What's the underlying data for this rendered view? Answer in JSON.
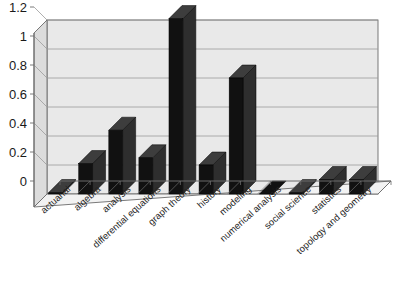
{
  "chart_data": {
    "type": "bar",
    "title": "",
    "subtitle": "",
    "xlabel": "",
    "ylabel": "",
    "categories": [
      "actuarial",
      "algebra",
      "analysis",
      "differential equations",
      "graph theory",
      "history",
      "modeling",
      "numerical analysis",
      "social science",
      "statistics",
      "topology and geometry"
    ],
    "values": [
      0.01,
      0.21,
      0.44,
      0.25,
      1.21,
      0.2,
      0.8,
      0.0,
      0.01,
      0.1,
      0.1
    ],
    "ytick_labels": [
      "0",
      "0.2",
      "0.4",
      "0.6",
      "0.8",
      "1",
      "1.2"
    ],
    "ytick_values": [
      0,
      0.2,
      0.4,
      0.6,
      0.8,
      1,
      1.2
    ],
    "ylim": [
      0,
      1.2
    ],
    "grid": true,
    "legend": false,
    "legend_position": "none",
    "style": "3d-column",
    "colors": {
      "bar_fill": "#111111",
      "bar_side": "#2e2e2e",
      "bar_top": "#3d3d3d",
      "plot_background": "#e9e9e9",
      "wall_side": "#dcdcdc",
      "floor": "#f2f2f2",
      "gridline": "#9a9a9a",
      "axis_line": "#6b6b6b",
      "text": "#1a1a1a"
    }
  }
}
